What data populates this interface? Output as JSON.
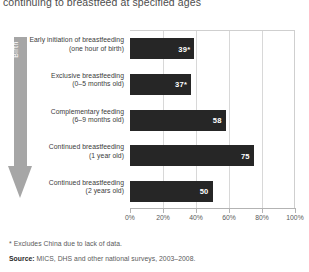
{
  "title": "continuing to breastfeed at specified ages",
  "axis_arrow": {
    "label": "Birth"
  },
  "footnotes": {
    "asterisk_note": "* Excludes China due to lack of data.",
    "source_lead": "Source:",
    "source_text": " MICS, DHS and other national surveys, 2003–2008."
  },
  "chart_data": {
    "type": "bar",
    "orientation": "horizontal",
    "title": "continuing to breastfeed at specified ages",
    "xlabel": "",
    "ylabel": "",
    "xlim": [
      0,
      100
    ],
    "grid": true,
    "legend": "none",
    "tick_labels": [
      "0%",
      "20%",
      "40%",
      "60%",
      "80%",
      "100%"
    ],
    "tick_values": [
      0,
      20,
      40,
      60,
      80,
      100
    ],
    "categories": [
      "Early initiation of breastfeeding\n(one hour of birth)",
      "Exclusive breastfeeding\n(0–5 months old)",
      "Complementary feeding\n(6–9 months old)",
      "Continued breastfeeding\n(1 year old)",
      "Continued breastfeeding\n(2 years old)"
    ],
    "values": [
      39,
      37,
      58,
      75,
      50
    ],
    "data_labels": [
      "39*",
      "37*",
      "58",
      "75",
      "50"
    ],
    "bars": [
      {
        "line1": "Early initiation of breastfeeding",
        "line2": "(one hour of birth)",
        "value": 39,
        "label": "39*"
      },
      {
        "line1": "Exclusive breastfeeding",
        "line2": "(0–5 months old)",
        "value": 37,
        "label": "37*"
      },
      {
        "line1": "Complementary feeding",
        "line2": "(6–9 months old)",
        "value": 58,
        "label": "58"
      },
      {
        "line1": "Continued breastfeeding",
        "line2": "(1 year old)",
        "value": 75,
        "label": "75"
      },
      {
        "line1": "Continued breastfeeding",
        "line2": "(2 years old)",
        "value": 50,
        "label": "50"
      }
    ],
    "colors": {
      "bar": "#262626",
      "grid": "#d8d8d8",
      "axis": "#b3b3b3",
      "arrow": "#a6a6a6",
      "text": "#5a5a5a"
    }
  }
}
